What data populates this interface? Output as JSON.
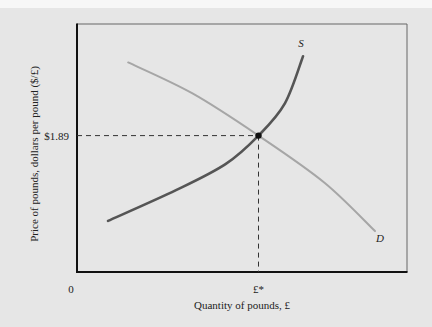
{
  "chart_data": {
    "type": "line",
    "title": "",
    "xlabel": "Quantity of pounds, £",
    "ylabel": "Price of pounds, dollars per pound ($/£)",
    "xlim": [
      0,
      100
    ],
    "ylim": [
      0,
      100
    ],
    "grid": false,
    "x_tick_labels": [
      {
        "label": "0",
        "x": 0
      },
      {
        "label": "£*",
        "x": 55
      }
    ],
    "y_tick_labels": [
      {
        "label": "$1.89",
        "y": 55
      }
    ],
    "series": [
      {
        "name": "S",
        "label": "S",
        "kind": "supply",
        "color": "#555555",
        "points": [
          [
            9.4,
            20.6
          ],
          [
            30,
            33
          ],
          [
            45,
            43.5
          ],
          [
            55,
            55
          ],
          [
            63,
            68
          ],
          [
            68.5,
            87
          ]
        ]
      },
      {
        "name": "D",
        "label": "D",
        "kind": "demand",
        "color": "#a6a6a6",
        "points": [
          [
            15.5,
            84.5
          ],
          [
            35,
            72
          ],
          [
            55,
            55
          ],
          [
            75,
            36
          ],
          [
            90.3,
            16.5
          ]
        ]
      }
    ],
    "equilibrium": {
      "x": 55,
      "y": 55,
      "x_label": "£*",
      "y_label": "$1.89"
    },
    "annotations": [
      "S",
      "D"
    ]
  },
  "colors": {
    "background": "#e6e6e6",
    "axis": "#111111",
    "frame": "#666666",
    "supply": "#555555",
    "demand": "#a6a6a6",
    "guide": "#333333",
    "point": "#111111"
  }
}
